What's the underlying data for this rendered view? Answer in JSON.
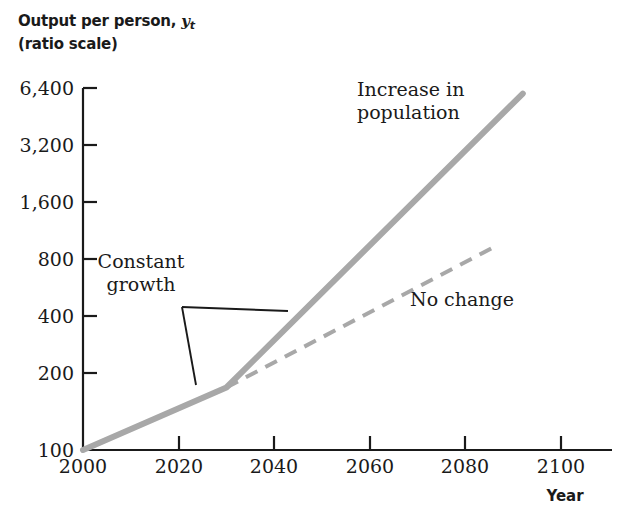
{
  "chart_data": {
    "type": "line",
    "title": "",
    "subtitle": "",
    "ylabel_line1": "Output per person, ",
    "ylabel_var": "y",
    "ylabel_sub": "t",
    "ylabel_line2": "(ratio scale)",
    "xlabel": "Year",
    "yscale": "log",
    "ylim": [
      100,
      6400
    ],
    "xlim": [
      2000,
      2100
    ],
    "grid": false,
    "legend": "none",
    "yticks": [
      "6,400",
      "3,200",
      "1,600",
      "800",
      "400",
      "200",
      "100"
    ],
    "ytick_values": [
      6400,
      3200,
      1600,
      800,
      400,
      200,
      100
    ],
    "xticks": [
      "2000",
      "2020",
      "2040",
      "2060",
      "2080",
      "2100"
    ],
    "xtick_values": [
      2000,
      2020,
      2040,
      2060,
      2080,
      2100
    ],
    "series": [
      {
        "name": "Increase in population",
        "style": "solid",
        "color": "#a8a8a8",
        "width": 6,
        "x": [
          2000,
          2030,
          2092
        ],
        "y": [
          100,
          205,
          6000
        ]
      },
      {
        "name": "No change",
        "style": "dashed",
        "color": "#a8a8a8",
        "width": 4,
        "x": [
          2030,
          2087
        ],
        "y": [
          205,
          1060
        ]
      }
    ],
    "annotations": [
      {
        "text": "Constant\ngrowth",
        "target_years": [
          2030,
          2042
        ]
      },
      {
        "text": "Increase in\npopulation",
        "target_year": 2075
      },
      {
        "text": "No change",
        "target_year": 2080
      }
    ],
    "colors": {
      "line": "#a8a8a8",
      "axis": "#1a1a1a",
      "text": "#1a1a1a",
      "background": "#ffffff"
    }
  },
  "annotations": {
    "constant_growth": "Constant\ngrowth",
    "increase_population": "Increase in\npopulation",
    "no_change": "No change"
  },
  "axes": {
    "y_title_prefix": "Output per person, ",
    "y_title_var": "y",
    "y_title_sub": "t",
    "y_title_second_line": "(ratio scale)",
    "x_title": "Year"
  },
  "yticks": [
    {
      "label": "6,400"
    },
    {
      "label": "3,200"
    },
    {
      "label": "1,600"
    },
    {
      "label": "800"
    },
    {
      "label": "400"
    },
    {
      "label": "200"
    },
    {
      "label": "100"
    }
  ],
  "xticks": [
    {
      "label": "2000"
    },
    {
      "label": "2020"
    },
    {
      "label": "2040"
    },
    {
      "label": "2060"
    },
    {
      "label": "2080"
    },
    {
      "label": "2100"
    }
  ]
}
